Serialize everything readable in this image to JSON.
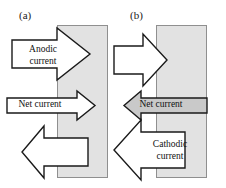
{
  "figure": {
    "type": "diagram",
    "background_color": "#ffffff",
    "electrode_fill": "#e2e2e2",
    "electrode_stroke": "#8f8f8f",
    "arrow_outline_color": "#1a1a1a",
    "arrow_white_fill": "#ffffff",
    "arrow_gray_fill": "#c9c9c9"
  },
  "panels": [
    {
      "id": "a",
      "label": "(a)",
      "arrows": [
        {
          "name": "anodic-current",
          "text_line1": "Anodic",
          "text_line2": "current",
          "direction": "right",
          "fill": "white",
          "size": "large"
        },
        {
          "name": "net-current",
          "text_line1": "Net current",
          "text_line2": "",
          "direction": "right",
          "fill": "white",
          "size": "small"
        },
        {
          "name": "cathodic-current-unlabeled",
          "text_line1": "",
          "text_line2": "",
          "direction": "left",
          "fill": "white",
          "size": "medium"
        }
      ]
    },
    {
      "id": "b",
      "label": "(b)",
      "arrows": [
        {
          "name": "anodic-current-unlabeled",
          "text_line1": "",
          "text_line2": "",
          "direction": "right",
          "fill": "white",
          "size": "medium"
        },
        {
          "name": "net-current",
          "text_line1": "Net current",
          "text_line2": "",
          "direction": "left",
          "fill": "gray",
          "size": "small"
        },
        {
          "name": "cathodic-current",
          "text_line1": "Cathodic",
          "text_line2": "current",
          "direction": "left",
          "fill": "white",
          "size": "large"
        }
      ]
    }
  ]
}
